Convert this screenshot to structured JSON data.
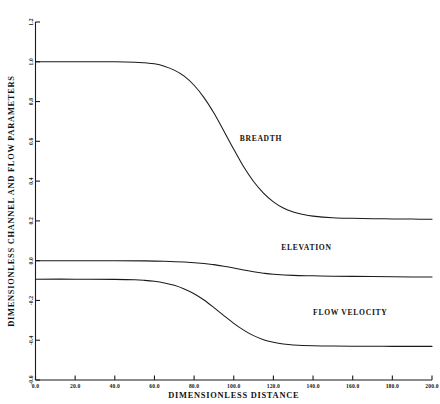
{
  "chart_data": {
    "type": "line",
    "title": "",
    "subtitle": "",
    "xlabel": "DIMENSIONLESS DISTANCE",
    "ylabel": "DIMENSIONLESS CHANNEL AND FLOW PARAMETERS",
    "xlim": [
      0.0,
      200.0
    ],
    "ylim": [
      -0.6,
      1.2
    ],
    "grid": false,
    "legend_position": "inline-annotations",
    "xticks": [
      0.0,
      20.0,
      40.0,
      60.0,
      80.0,
      100.0,
      120.0,
      140.0,
      160.0,
      180.0,
      200.0
    ],
    "xtick_labels": [
      "0.0",
      "20.0",
      "40.0",
      "60.0",
      "80.0",
      "100.0",
      "120.0",
      "140.0",
      "160.0",
      "180.0",
      "200.0"
    ],
    "yticks": [
      -0.6,
      -0.4,
      -0.2,
      0.0,
      0.2,
      0.4,
      0.6,
      0.8,
      1.0,
      1.2
    ],
    "ytick_labels": [
      "-0.6",
      "-0.4",
      "-0.2",
      "0.0",
      "0.2",
      "0.4",
      "0.6",
      "0.8",
      "1.0",
      "1.2"
    ],
    "series": [
      {
        "name": "BREADTH",
        "annotation": "BREADTH",
        "annotation_x": 103.0,
        "annotation_y": 0.6,
        "x": [
          0,
          10,
          20,
          30,
          40,
          50,
          55,
          60,
          65,
          70,
          75,
          80,
          85,
          90,
          95,
          100,
          105,
          110,
          115,
          120,
          125,
          130,
          135,
          140,
          150,
          160,
          170,
          180,
          190,
          200
        ],
        "values": [
          1.0,
          1.0,
          1.0,
          1.0,
          1.0,
          0.998,
          0.995,
          0.99,
          0.978,
          0.958,
          0.928,
          0.882,
          0.82,
          0.742,
          0.652,
          0.56,
          0.472,
          0.398,
          0.34,
          0.296,
          0.265,
          0.245,
          0.232,
          0.224,
          0.216,
          0.213,
          0.211,
          0.21,
          0.209,
          0.208
        ]
      },
      {
        "name": "ELEVATION",
        "annotation": "ELEVATION",
        "annotation_x": 124.0,
        "annotation_y": 0.055,
        "x": [
          0,
          20,
          40,
          55,
          65,
          75,
          85,
          90,
          95,
          100,
          105,
          110,
          115,
          120,
          130,
          140,
          150,
          160,
          170,
          180,
          190,
          200
        ],
        "values": [
          0.0,
          0.0,
          0.0,
          -0.001,
          -0.003,
          -0.007,
          -0.014,
          -0.02,
          -0.028,
          -0.037,
          -0.047,
          -0.056,
          -0.063,
          -0.068,
          -0.074,
          -0.076,
          -0.078,
          -0.079,
          -0.08,
          -0.081,
          -0.082,
          -0.082
        ]
      },
      {
        "name": "FLOW VELOCITY",
        "annotation": "FLOW VELOCITY",
        "annotation_x": 140.0,
        "annotation_y": -0.275,
        "x": [
          0,
          20,
          40,
          50,
          55,
          60,
          65,
          70,
          75,
          80,
          85,
          90,
          95,
          100,
          105,
          110,
          115,
          120,
          125,
          130,
          140,
          150,
          160,
          170,
          180,
          190,
          200
        ],
        "values": [
          -0.093,
          -0.093,
          -0.094,
          -0.096,
          -0.099,
          -0.104,
          -0.112,
          -0.124,
          -0.142,
          -0.166,
          -0.198,
          -0.236,
          -0.276,
          -0.315,
          -0.349,
          -0.377,
          -0.397,
          -0.41,
          -0.419,
          -0.424,
          -0.428,
          -0.429,
          -0.43,
          -0.43,
          -0.431,
          -0.431,
          -0.431
        ]
      }
    ]
  }
}
